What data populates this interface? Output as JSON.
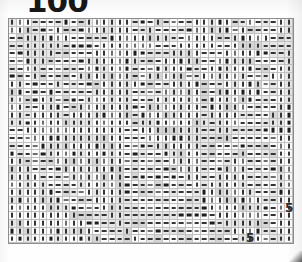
{
  "page": {
    "kind": "scanned-document-page",
    "page_number": "100",
    "ink_color": "#343434",
    "paper_color": "#fdfdfd",
    "rule_color": "#c2c2c2"
  },
  "artifacts": [
    {
      "name": "stray-digit-right",
      "text": "5"
    },
    {
      "name": "stray-digit-bottom",
      "text": "5"
    }
  ],
  "matrix": {
    "rows": 29,
    "cols": 37,
    "glyph_legend": {
      "dash": "—",
      "bar": "|"
    },
    "cells": [
      "|||----|--||||||---|----|||||--|---||",
      "|||---|---||||||--|-----|||||-|----||",
      "--||||||-----||||||||--||||--|||||---",
      "--|||||-----|||||||---|||||--||||----",
      "--||||-----||||||----||||---|||||---|",
      "--|||-----|||||||---|||||--|||||----|",
      "--||------||||||---||||---||||||---||",
      "---|-----|||||||--|||||--||||||---|||",
      "||----|-----|||||----||||---|||||--||",
      "||---|-----|||||----|||||--||||||--||",
      "||--||----||||||---||||||-||||||---||",
      "||--|||--|||||||--|||||||-|||||----||",
      "||-||||-||||||||-||||||||-||||----|||",
      "||-|||||||||||||-|||||||||-|||----|||",
      "--|||||||||||||--||||||||--||-----|||",
      "---||||||||||||---|||||||---|------||",
      "----|||||||||||----||||||----------||",
      "|----||||||||||-----|||||-----|----||",
      "||----|||||||||------||||----||----||",
      "|||----||||||||-------|||---|||----||",
      "||||----|||||||--------||--||||----||",
      "|||||----||||||---------|-|||||----||",
      "||||||----|||||----------|||||||---||",
      "|||||||----||||----------||||||||--||",
      "||||||||----|||-----------|||||||--||",
      "|||||||||----||------------||||||--||",
      "||||||||||----|-------------|||||--||",
      "|||||||||||----|-------------||||--||",
      "||||||||||||----|-------------|||--||"
    ]
  }
}
